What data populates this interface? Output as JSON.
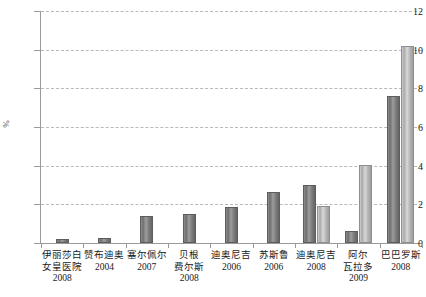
{
  "chart_data": {
    "type": "bar",
    "title": "",
    "xlabel": "",
    "ylabel": "%",
    "ylim": [
      0,
      12
    ],
    "yticks": [
      0,
      2,
      4,
      6,
      8,
      10,
      12
    ],
    "grid": true,
    "legend": "none",
    "categories": [
      "伊丽莎白女皇医院 2008",
      "赞布迪奥 2004",
      "塞尔佩尔 2007",
      "贝根费尔斯 2008",
      "迪奥尼吉 2006",
      "苏斯鲁 2006",
      "迪奥尼吉 2008",
      "阿尔瓦拉多 2009",
      "巴巴罗斯 2008"
    ],
    "series": [
      {
        "name": "series-dark",
        "values": [
          0.2,
          0.25,
          1.4,
          1.5,
          1.85,
          2.65,
          3.0,
          0.6,
          7.6
        ]
      },
      {
        "name": "series-light",
        "values": [
          null,
          null,
          null,
          null,
          null,
          null,
          1.9,
          4.05,
          10.2
        ]
      }
    ]
  },
  "axis": {
    "y_title": "%",
    "y_tick_labels": [
      "0",
      "2",
      "4",
      "6",
      "8",
      "10",
      "12"
    ]
  },
  "x_categories": [
    {
      "name": "伊丽莎白白\n女皇医院",
      "name_lines": [
        "伊丽莎白",
        "女皇医院"
      ],
      "year": "2008"
    },
    {
      "name_lines": [
        "赞布迪奥"
      ],
      "year": "2004"
    },
    {
      "name_lines": [
        "塞尔佩尔"
      ],
      "year": "2007"
    },
    {
      "name_lines": [
        "贝根",
        "费尔斯"
      ],
      "year": "2008"
    },
    {
      "name_lines": [
        "迪奥尼吉"
      ],
      "year": "2006"
    },
    {
      "name_lines": [
        "苏斯鲁"
      ],
      "year": "2006"
    },
    {
      "name_lines": [
        "迪奥尼吉"
      ],
      "year": "2008"
    },
    {
      "name_lines": [
        "阿尔",
        "瓦拉多"
      ],
      "year": "2009"
    },
    {
      "name_lines": [
        "巴巴罗斯"
      ],
      "year": "2008"
    }
  ],
  "colors": {
    "bar_dark": "#7b7b7b",
    "bar_light": "#c0c0c0",
    "axis": "#9a9a9a",
    "grid": "#b9b9b9",
    "text": "#1a1a1a",
    "background": "#ffffff"
  }
}
